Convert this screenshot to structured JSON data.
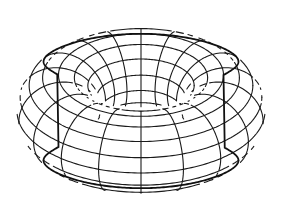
{
  "figure": {
    "canvas": {
      "width": 281,
      "height": 217,
      "background": "#ffffff"
    },
    "colors": {
      "line": "#1a1a1a",
      "outline": "#111111"
    },
    "geometry": {
      "center_x": 141,
      "center_y": 111,
      "major_radius": 82.5,
      "minor_radius": 41.5,
      "elevation_sin": 0.5,
      "meridian_count": 18,
      "meridian_offset_deg": 10,
      "parallel_count": 16,
      "line_width": 1.1,
      "outline_width": 1.8
    }
  }
}
